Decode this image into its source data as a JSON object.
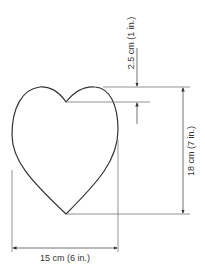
{
  "diagram": {
    "shape": "heart",
    "stroke_color": "#333333",
    "line_color": "#555555",
    "dimensions": {
      "notch_depth": "2.5 cm (1 in.)",
      "height": "18 cm (7 in.)",
      "width": "15 cm (6 in.)"
    }
  }
}
